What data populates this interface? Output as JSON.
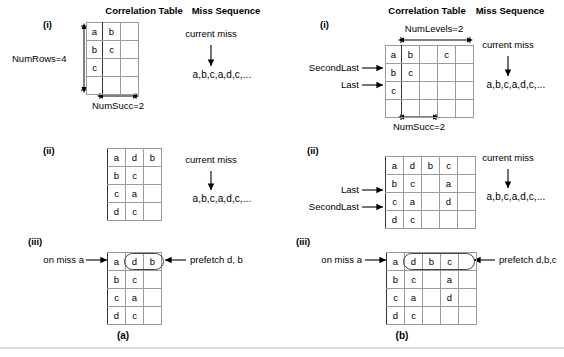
{
  "figure": {
    "panel_a_label": "(a)",
    "panel_b_label": "(b)",
    "headers": {
      "correlation_table": "Correlation Table",
      "miss_sequence": "Miss Sequence"
    },
    "step_labels": {
      "i": "(i)",
      "ii": "(ii)",
      "iii": "(iii)"
    }
  },
  "panel_a": {
    "step_i": {
      "label": "(i)",
      "numrows_label": "NumRows=4",
      "numsucc_label": "NumSucc=2",
      "current_miss_label": "current miss",
      "miss_sequence": "a,b,c,a,d,c,...",
      "table": {
        "rows": [
          [
            "a",
            "b",
            ""
          ],
          [
            "b",
            "c",
            ""
          ],
          [
            "c",
            "",
            ""
          ],
          [
            "",
            "",
            ""
          ]
        ]
      }
    },
    "step_ii": {
      "label": "(ii)",
      "current_miss_label": "current miss",
      "miss_sequence": "a,b,c,a,d,c,...",
      "table": {
        "rows": [
          [
            "a",
            "d",
            "b"
          ],
          [
            "b",
            "c",
            ""
          ],
          [
            "c",
            "a",
            ""
          ],
          [
            "d",
            "c",
            ""
          ]
        ]
      }
    },
    "step_iii": {
      "label": "(iii)",
      "on_miss_label": "on miss a",
      "prefetch_label": "prefetch d, b",
      "table": {
        "rows": [
          [
            "a",
            "d",
            "b"
          ],
          [
            "b",
            "c",
            ""
          ],
          [
            "c",
            "a",
            ""
          ],
          [
            "d",
            "c",
            ""
          ]
        ]
      }
    }
  },
  "panel_b": {
    "step_i": {
      "label": "(i)",
      "numlevels_label": "NumLevels=2",
      "numsucc_label": "NumSucc=2",
      "secondlast_label": "SecondLast",
      "last_label": "Last",
      "current_miss_label": "current miss",
      "miss_sequence": "a,b,c,a,d,c,...",
      "table": {
        "rows": [
          [
            "a",
            "b",
            "",
            "c",
            ""
          ],
          [
            "b",
            "c",
            "",
            "",
            ""
          ],
          [
            "c",
            "",
            "",
            "",
            ""
          ],
          [
            "",
            "",
            "",
            "",
            ""
          ]
        ]
      }
    },
    "step_ii": {
      "label": "(ii)",
      "last_label": "Last",
      "secondlast_label": "SecondLast",
      "current_miss_label": "current miss",
      "miss_sequence": "a,b,c,a,d,c,...",
      "table": {
        "rows": [
          [
            "a",
            "d",
            "b",
            "c",
            ""
          ],
          [
            "b",
            "c",
            "",
            "a",
            ""
          ],
          [
            "c",
            "a",
            "",
            "d",
            ""
          ],
          [
            "d",
            "c",
            "",
            "",
            ""
          ]
        ]
      }
    },
    "step_iii": {
      "label": "(iii)",
      "on_miss_label": "on miss a",
      "prefetch_label": "prefetch d,b,c",
      "table": {
        "rows": [
          [
            "a",
            "d",
            "b",
            "c",
            ""
          ],
          [
            "b",
            "c",
            "",
            "a",
            ""
          ],
          [
            "c",
            "a",
            "",
            "d",
            ""
          ],
          [
            "d",
            "c",
            "",
            "",
            ""
          ]
        ]
      }
    }
  }
}
